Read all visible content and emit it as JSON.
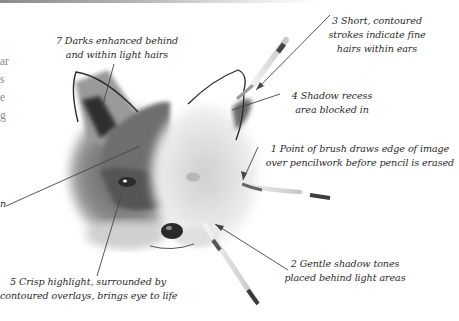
{
  "page": {
    "body_text_fragments": [
      "ar",
      "s",
      "e",
      "g"
    ],
    "left_caption_fragment": "n"
  },
  "captions": {
    "c7": {
      "number": "7",
      "line1": "7 Darks enhanced behind",
      "line2": "and within light hairs"
    },
    "c3": {
      "number": "3",
      "line1": "3 Short, contoured",
      "line2": "strokes indicate fine",
      "line3": "hairs within ears"
    },
    "c4": {
      "number": "4",
      "line1": "4 Shadow recess",
      "line2": "area blocked in"
    },
    "c1": {
      "number": "1",
      "line1": "1 Point of brush draws edge of image",
      "line2": "over pencilwork before pencil is erased"
    },
    "c2": {
      "number": "2",
      "line1": "2 Gentle shadow tones",
      "line2": "placed behind light areas"
    },
    "c5": {
      "number": "5",
      "line1": "5 Crisp highlight, surrounded by",
      "line2": "contoured overlays, brings eye to life"
    }
  },
  "illustration": {
    "subject": "fox-head-watercolour-study",
    "colors": {
      "ink": "#333333",
      "dark_fur": "#3a3a3a",
      "mid_fur": "#8c8c8c",
      "light_fur": "#d4d4d4",
      "leader": "#444444"
    }
  }
}
